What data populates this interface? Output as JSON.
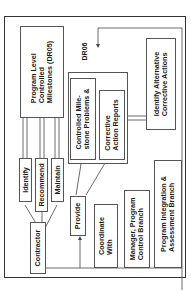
{
  "diagram": {
    "nodes": {
      "program_level": "Program Level|Controlled|Milestones (DR05)",
      "identify": "Identify",
      "recommend": "Recommend",
      "maintain": "Maintain",
      "contractor": "Contractor",
      "provide": "Provide",
      "controlled_milestone": "Controlled Mile-|stone Problems &",
      "corrective_action": "Corrective|Action Reports",
      "identify_alternative": "Identify Alternative|Corrective Actions",
      "coordinate_with": "Coordinate|With",
      "manager": "Manager, Program|Control Branch",
      "program_integration": "Program Integration &|Assessment Branch"
    },
    "labels": {
      "dr06": "DR06"
    }
  }
}
